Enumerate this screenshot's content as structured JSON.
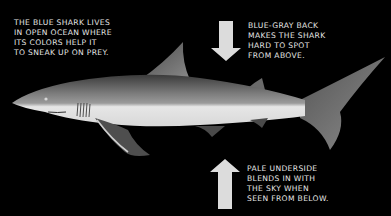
{
  "figure": {
    "subject": "blue shark",
    "colors": {
      "background": "#000000",
      "back": "#6e6e6e",
      "belly": "#e4e4e4",
      "arrow": "#dcdcdc",
      "text": "#e6e6e6"
    },
    "captions": {
      "left": {
        "lines": [
          "THE BLUE SHARK LIVES",
          "IN OPEN OCEAN WHERE",
          "ITS COLORS HELP IT",
          "TO SNEAK UP ON PREY."
        ],
        "text": "THE BLUE SHARK LIVES\nIN OPEN OCEAN WHERE\nITS COLORS HELP IT\nTO SNEAK UP ON PREY."
      },
      "top_right": {
        "lines": [
          "BLUE-GRAY BACK",
          "MAKES THE SHARK",
          "HARD TO SPOT",
          "FROM ABOVE."
        ],
        "text": "BLUE-GRAY BACK\nMAKES THE SHARK\nHARD TO SPOT\nFROM ABOVE."
      },
      "bottom_right": {
        "lines": [
          "PALE UNDERSIDE",
          "BLENDS IN WITH",
          "THE SKY WHEN",
          "SEEN FROM BELOW."
        ],
        "text": "PALE UNDERSIDE\nBLENDS IN WITH\nTHE SKY WHEN\nSEEN FROM BELOW."
      }
    },
    "icons": {
      "top_arrow": "arrow-down-icon",
      "bottom_arrow": "arrow-up-icon"
    }
  }
}
